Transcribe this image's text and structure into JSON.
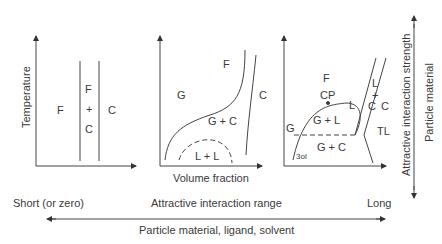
{
  "panel1": {
    "ylabel": "Temperature",
    "regions": {
      "left": "F",
      "mid_top": "F",
      "mid_plus": "+",
      "mid_bottom": "C",
      "right": "C"
    }
  },
  "panel2": {
    "xlabel": "Volume fraction",
    "regions": {
      "G": "G",
      "F": "F",
      "C": "C",
      "GC": "G + C",
      "LL": "L + L"
    }
  },
  "panel3": {
    "regions": {
      "F": "F",
      "CP": "CP",
      "G": "G",
      "GL": "G + L",
      "L": "L",
      "L_top": "L",
      "plus": "+",
      "C_mid": "C",
      "C": "C",
      "TL": "TL",
      "GC": "G + C",
      "sol": "3ol"
    }
  },
  "right_axis": {
    "label1": "Attractive interaction strength",
    "label2": "Particle material"
  },
  "bottom_axis": {
    "left": "Short (or zero)",
    "center": "Attractive interaction range",
    "right": "Long",
    "sub": "Particle material, ligand, solvent"
  }
}
